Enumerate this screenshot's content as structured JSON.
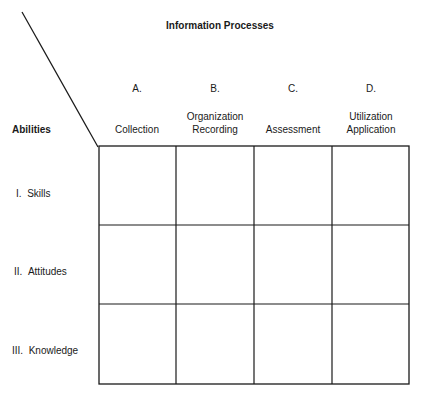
{
  "diagram": {
    "title": "Information Processes",
    "row_axis_label": "Abilities",
    "columns": [
      {
        "letter": "A.",
        "label_line1": "",
        "label_line2": "Collection"
      },
      {
        "letter": "B.",
        "label_line1": "Organization",
        "label_line2": "Recording"
      },
      {
        "letter": "C.",
        "label_line1": "",
        "label_line2": "Assessment"
      },
      {
        "letter": "D.",
        "label_line1": "Utilization",
        "label_line2": "Application"
      }
    ],
    "rows": [
      {
        "numeral": "I.",
        "label": "Skills"
      },
      {
        "numeral": "II.",
        "label": "Attitudes"
      },
      {
        "numeral": "III.",
        "label": "Knowledge"
      }
    ],
    "line_color": "#1a1a1a"
  }
}
